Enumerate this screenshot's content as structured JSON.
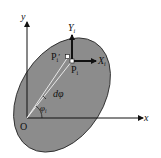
{
  "diagram": {
    "colors": {
      "ellipse_fill": "#8c8c8c",
      "ellipse_stroke": "#222222",
      "axis": "#111111",
      "background": "#ffffff"
    },
    "labels": {
      "y_axis": "y",
      "x_axis": "x",
      "origin": "O",
      "local_y": "Y",
      "local_y_sub": "i",
      "local_x": "X",
      "local_x_sub": "i",
      "point": "P",
      "point_sub": "i",
      "point_prime": "P",
      "point_prime_sub": "i",
      "point_prime_mark": "′",
      "dphi": "dφ",
      "phi": "φ",
      "phi_sub": "i"
    }
  }
}
